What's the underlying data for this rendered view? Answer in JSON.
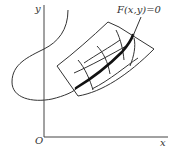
{
  "diagram": {
    "axes": {
      "y_label": "y",
      "x_label": "x",
      "origin_label": "O"
    },
    "curve_label": "F(x,y)=0",
    "elements": [
      "y-axis",
      "x-axis",
      "implicit S-shaped curve F(x,y)=0",
      "curvilinear coordinate patch (grid)",
      "highlighted bold segment of curve inside patch",
      "leader line from label to curve"
    ],
    "colors": {
      "line": "#333333",
      "background": "#ffffff"
    }
  }
}
